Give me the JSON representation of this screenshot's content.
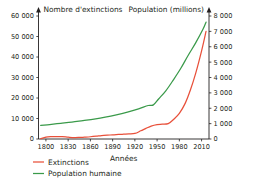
{
  "chart_data": {
    "type": "line",
    "title": "",
    "xlabel": "Années",
    "ylabel_left": "Nombre d'extinctions",
    "ylabel_right": "Population (millions)",
    "grid": false,
    "legend_position": "bottom-left",
    "xlim": [
      1790,
      2020
    ],
    "xticks": [
      1800,
      1830,
      1860,
      1890,
      1920,
      1950,
      1980,
      2010
    ],
    "xtick_labels": [
      "1800",
      "1830",
      "1860",
      "1890",
      "1920",
      "1950",
      "1980",
      "2010"
    ],
    "ylim_left": [
      0,
      60000
    ],
    "yticks_left": [
      0,
      10000,
      20000,
      30000,
      40000,
      50000,
      60000
    ],
    "ytick_labels_left": [
      "0",
      "10 000",
      "20 000",
      "30 000",
      "40 000",
      "50 000",
      "60 000"
    ],
    "ylim_right": [
      0,
      8000
    ],
    "yticks_right": [
      0,
      1000,
      2000,
      3000,
      4000,
      5000,
      6000,
      7000,
      8000
    ],
    "ytick_labels_right": [
      "0",
      "1 000",
      "2 000",
      "3 000",
      "4 000",
      "5 000",
      "6 000",
      "7 000",
      "8 000"
    ],
    "series": [
      {
        "name": "Extinctions",
        "axis": "left",
        "color": "#e8503a",
        "x": [
          1793,
          1800,
          1807,
          1815,
          1822,
          1830,
          1838,
          1845,
          1852,
          1860,
          1868,
          1875,
          1883,
          1890,
          1898,
          1905,
          1912,
          1920,
          1928,
          1935,
          1942,
          1950,
          1957,
          1965,
          1972,
          1980,
          1988,
          1995,
          2002,
          2010,
          2016
        ],
        "y": [
          200,
          900,
          1150,
          1200,
          1150,
          900,
          700,
          750,
          900,
          1100,
          1400,
          1700,
          1900,
          2000,
          2200,
          2350,
          2500,
          2700,
          4000,
          5200,
          6300,
          7000,
          7200,
          7500,
          9500,
          12500,
          17500,
          24000,
          32000,
          43000,
          52500
        ]
      },
      {
        "name": "Population humaine",
        "axis": "right",
        "color": "#3a9a4a",
        "x": [
          1793,
          1805,
          1820,
          1835,
          1850,
          1865,
          1880,
          1895,
          1910,
          1925,
          1938,
          1945,
          1952,
          1962,
          1972,
          1982,
          1992,
          2002,
          2012,
          2016
        ],
        "y": [
          880,
          940,
          1020,
          1100,
          1200,
          1300,
          1420,
          1570,
          1750,
          1960,
          2180,
          2220,
          2600,
          3150,
          3850,
          4600,
          5450,
          6250,
          7150,
          7600
        ]
      }
    ],
    "legend": [
      {
        "label": "Extinctions",
        "color": "#e8503a"
      },
      {
        "label": "Population humaine",
        "color": "#3a9a4a"
      }
    ]
  }
}
